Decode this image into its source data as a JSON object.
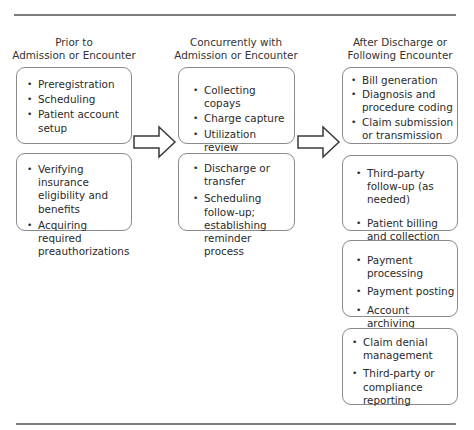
{
  "diagram": {
    "columns": [
      {
        "header_line1": "Prior to",
        "header_line2": "Admission or Encounter",
        "boxes": [
          {
            "items": [
              "Preregistration",
              "Scheduling",
              "Patient account setup"
            ]
          },
          {
            "items": [
              "Verifying insurance eligibility and benefits",
              "Acquiring required preauthorizations"
            ]
          }
        ]
      },
      {
        "header_line1": "Concurrently with",
        "header_line2": "Admission or Encounter",
        "boxes": [
          {
            "items": [
              "Collecting copays",
              "Charge capture",
              "Utilization review"
            ]
          },
          {
            "items": [
              "Discharge or transfer",
              "Scheduling follow-up; establishing reminder process"
            ]
          }
        ]
      },
      {
        "header_line1": "After Discharge or",
        "header_line2": "Following Encounter",
        "boxes": [
          {
            "items": [
              "Bill generation",
              "Diagnosis and procedure coding",
              "Claim submission or transmission"
            ]
          },
          {
            "items": [
              "Third-party follow-up (as needed)",
              "Patient billing and collection"
            ]
          },
          {
            "items": [
              "Payment processing",
              "Payment posting",
              "Account archiving"
            ]
          },
          {
            "items": [
              "Claim denial management",
              "Third-party or compliance reporting"
            ]
          }
        ]
      }
    ],
    "arrows": [
      {
        "from": "column-1",
        "to": "column-2",
        "icon": "right-arrow-icon"
      },
      {
        "from": "column-2",
        "to": "column-3",
        "icon": "right-arrow-icon"
      }
    ],
    "bullet": "•",
    "colors": {
      "border": "#8a8a8a",
      "rule": "#7d7d7d",
      "text": "#2a2a2a"
    }
  }
}
